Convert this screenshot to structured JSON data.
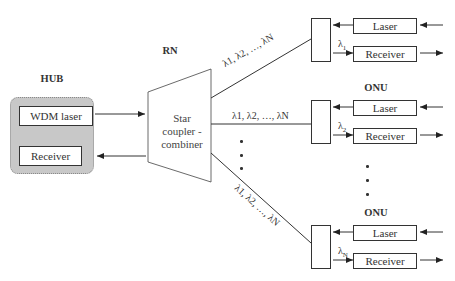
{
  "hub": {
    "title": "HUB",
    "laser": "WDM laser",
    "receiver": "Receiver"
  },
  "rn": {
    "title": "RN",
    "coupler_line1": "Star",
    "coupler_line2": "coupler -",
    "coupler_line3": "combiner"
  },
  "onus": [
    {
      "title": "",
      "laser": "Laser",
      "receiver": "Receiver",
      "wavelength": "λ",
      "wavelength_sub": "1"
    },
    {
      "title": "ONU",
      "laser": "Laser",
      "receiver": "Receiver",
      "wavelength": "λ",
      "wavelength_sub": "2"
    },
    {
      "title": "ONU",
      "laser": "Laser",
      "receiver": "Receiver",
      "wavelength": "λ",
      "wavelength_sub": "N"
    }
  ],
  "links": {
    "top_label": "λ1, λ2, …, λN",
    "middle_label": "λ1, λ2, …, λN",
    "bottom_label": "λ1, λ2, …, λN"
  },
  "colors": {
    "group_fill": "#c8c8c8",
    "line": "#333333"
  }
}
